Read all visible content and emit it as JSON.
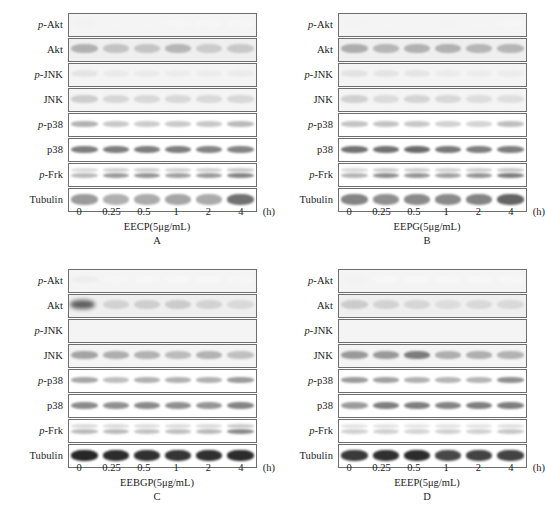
{
  "figure": {
    "type": "western-blot-panels",
    "row_labels": [
      "p-Akt",
      "Akt",
      "p-JNK",
      "JNK",
      "p-p38",
      "p38",
      "p-Frk",
      "Tubulin"
    ],
    "time_points": [
      "0",
      "0.25",
      "0.5",
      "1",
      "2",
      "4"
    ],
    "time_unit": "(h)"
  },
  "chart_data": {
    "type": "heatmap",
    "title": "",
    "xlabel": "Treatment time (h)",
    "ylabel": "Protein",
    "categories": [
      "0",
      "0.25",
      "0.5",
      "1",
      "2",
      "4"
    ],
    "rows": [
      "p-Akt",
      "Akt",
      "p-JNK",
      "JNK",
      "p-p38",
      "p38",
      "p-Frk",
      "Tubulin"
    ],
    "panels": [
      {
        "letter": "A",
        "treatment": "EECP(5μg/mL)",
        "series": [
          {
            "name": "p-Akt",
            "values": [
              0.06,
              0.04,
              0.04,
              0.03,
              0.03,
              0.03
            ]
          },
          {
            "name": "Akt",
            "values": [
              0.42,
              0.34,
              0.33,
              0.4,
              0.3,
              0.31
            ]
          },
          {
            "name": "p-JNK",
            "values": [
              0.16,
              0.13,
              0.12,
              0.11,
              0.11,
              0.12
            ]
          },
          {
            "name": "JNK",
            "values": [
              0.3,
              0.25,
              0.24,
              0.24,
              0.23,
              0.24
            ]
          },
          {
            "name": "p-p38",
            "values": [
              0.44,
              0.34,
              0.32,
              0.33,
              0.34,
              0.4
            ]
          },
          {
            "name": "p38",
            "values": [
              0.62,
              0.62,
              0.62,
              0.62,
              0.6,
              0.6
            ]
          },
          {
            "name": "p-Frk",
            "values": [
              0.4,
              0.52,
              0.54,
              0.5,
              0.52,
              0.6
            ]
          },
          {
            "name": "Tubulin",
            "values": [
              0.52,
              0.44,
              0.46,
              0.48,
              0.46,
              0.66
            ]
          }
        ]
      },
      {
        "letter": "B",
        "treatment": "EEPG(5μg/mL)",
        "series": [
          {
            "name": "p-Akt",
            "values": [
              0.05,
              0.04,
              0.04,
              0.05,
              0.04,
              0.03
            ]
          },
          {
            "name": "Akt",
            "values": [
              0.44,
              0.4,
              0.42,
              0.42,
              0.4,
              0.4
            ]
          },
          {
            "name": "p-JNK",
            "values": [
              0.18,
              0.17,
              0.16,
              0.12,
              0.11,
              0.11
            ]
          },
          {
            "name": "JNK",
            "values": [
              0.28,
              0.22,
              0.26,
              0.24,
              0.21,
              0.2
            ]
          },
          {
            "name": "p-p38",
            "values": [
              0.36,
              0.36,
              0.34,
              0.3,
              0.28,
              0.38
            ]
          },
          {
            "name": "p38",
            "values": [
              0.66,
              0.66,
              0.68,
              0.64,
              0.62,
              0.62
            ]
          },
          {
            "name": "p-Frk",
            "values": [
              0.42,
              0.56,
              0.54,
              0.5,
              0.54,
              0.62
            ]
          },
          {
            "name": "Tubulin",
            "values": [
              0.6,
              0.56,
              0.58,
              0.58,
              0.6,
              0.7
            ]
          }
        ]
      },
      {
        "letter": "C",
        "treatment": "EEBGP(5μg/mL)",
        "series": [
          {
            "name": "p-Akt",
            "values": [
              0.1,
              0.03,
              0.02,
              0.02,
              0.02,
              0.03
            ]
          },
          {
            "name": "Akt",
            "values": [
              0.72,
              0.26,
              0.28,
              0.3,
              0.26,
              0.22
            ]
          },
          {
            "name": "p-JNK",
            "values": [
              0.0,
              0.0,
              0.0,
              0.0,
              0.0,
              0.0
            ]
          },
          {
            "name": "JNK",
            "values": [
              0.48,
              0.44,
              0.42,
              0.38,
              0.42,
              0.36
            ]
          },
          {
            "name": "p-p38",
            "values": [
              0.48,
              0.38,
              0.44,
              0.44,
              0.44,
              0.52
            ]
          },
          {
            "name": "p38",
            "values": [
              0.58,
              0.56,
              0.58,
              0.56,
              0.54,
              0.6
            ]
          },
          {
            "name": "p-Frk",
            "values": [
              0.4,
              0.4,
              0.36,
              0.38,
              0.4,
              0.58
            ]
          },
          {
            "name": "Tubulin",
            "values": [
              0.92,
              0.9,
              0.88,
              0.86,
              0.88,
              0.9
            ]
          }
        ]
      },
      {
        "letter": "D",
        "treatment": "EEEP(5μg/mL)",
        "series": [
          {
            "name": "p-Akt",
            "values": [
              0.06,
              0.02,
              0.02,
              0.02,
              0.02,
              0.02
            ]
          },
          {
            "name": "Akt",
            "values": [
              0.3,
              0.26,
              0.24,
              0.2,
              0.22,
              0.22
            ]
          },
          {
            "name": "p-JNK",
            "values": [
              0.0,
              0.0,
              0.0,
              0.0,
              0.0,
              0.0
            ]
          },
          {
            "name": "JNK",
            "values": [
              0.52,
              0.52,
              0.62,
              0.44,
              0.44,
              0.42
            ]
          },
          {
            "name": "p-p38",
            "values": [
              0.52,
              0.5,
              0.44,
              0.42,
              0.42,
              0.56
            ]
          },
          {
            "name": "p38",
            "values": [
              0.52,
              0.62,
              0.62,
              0.6,
              0.62,
              0.62
            ]
          },
          {
            "name": "p-Frk",
            "values": [
              0.3,
              0.3,
              0.28,
              0.3,
              0.3,
              0.34
            ]
          },
          {
            "name": "Tubulin",
            "values": [
              0.84,
              0.88,
              0.9,
              0.78,
              0.8,
              0.8
            ]
          }
        ]
      }
    ]
  },
  "panels": {
    "A": {
      "letter": "A",
      "treatment": "EECP(5μg/mL)"
    },
    "B": {
      "letter": "B",
      "treatment": "EEPG(5μg/mL)"
    },
    "C": {
      "letter": "C",
      "treatment": "EEBGP(5μg/mL)"
    },
    "D": {
      "letter": "D",
      "treatment": "EEEP(5μg/mL)"
    }
  }
}
